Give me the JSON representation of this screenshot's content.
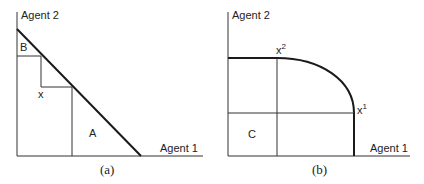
{
  "panel_a": {
    "y_axis_label": "Agent 2",
    "x_axis_label": "Agent 1",
    "region_b_label": "B",
    "point_label": "x",
    "region_a_label": "A",
    "caption": "(a)"
  },
  "panel_b": {
    "y_axis_label": "Agent 2",
    "x_axis_label": "Agent 1",
    "point_x2_label": "x",
    "point_x2_sup": "2",
    "point_x1_label": "x",
    "point_x1_sup": "1",
    "region_c_label": "C",
    "caption": "(b)"
  },
  "colors": {
    "line": "#1a1a1a",
    "text": "#222222",
    "background": "#ffffff"
  }
}
